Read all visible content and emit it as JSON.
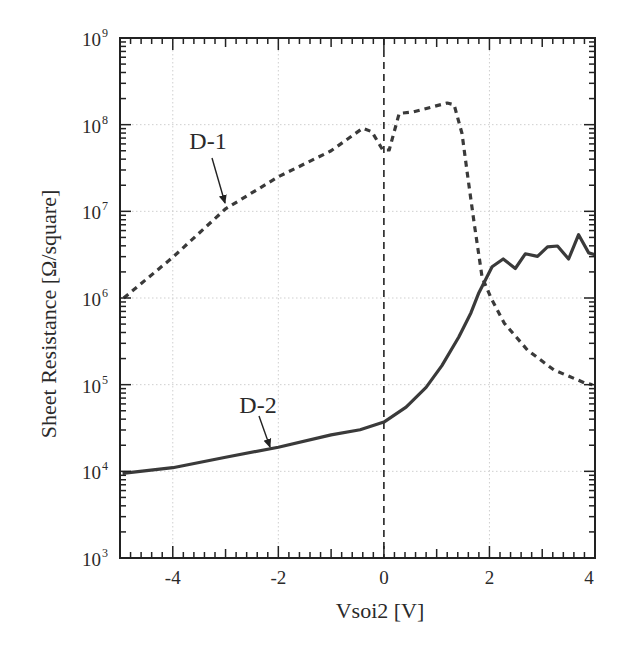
{
  "chart_data": {
    "type": "line",
    "title": "",
    "xlabel": "Vsoi2 [V]",
    "ylabel": "Sheet Resistance [Ω/square]",
    "xlim": [
      -5,
      4
    ],
    "ylim": [
      1000,
      1000000000
    ],
    "yscale": "log",
    "x_ticks": [
      -4,
      -2,
      0,
      2,
      4
    ],
    "x_tick_labels": [
      "-4",
      "-2",
      "0",
      "2",
      "4"
    ],
    "y_ticks": [
      1000,
      10000,
      100000,
      1000000,
      10000000,
      100000000,
      1000000000
    ],
    "y_tick_labels": [
      {
        "base": "10",
        "exp": "3"
      },
      {
        "base": "10",
        "exp": "4"
      },
      {
        "base": "10",
        "exp": "5"
      },
      {
        "base": "10",
        "exp": "6"
      },
      {
        "base": "10",
        "exp": "7"
      },
      {
        "base": "10",
        "exp": "8"
      },
      {
        "base": "10",
        "exp": "9"
      }
    ],
    "grid": true,
    "legend": null,
    "reference_lines": [
      {
        "orientation": "vertical",
        "x": 0,
        "style": "dashed"
      }
    ],
    "annotations": [
      {
        "text": "D-1",
        "arrow_to": {
          "x": -2.97,
          "y": 10700000
        }
      },
      {
        "text": "D-2",
        "arrow_to": {
          "x": -2.15,
          "y": 17800
        }
      }
    ],
    "series": [
      {
        "name": "D-1",
        "style": "dashed",
        "x": [
          -4.93,
          -4.0,
          -3.0,
          -2.0,
          -1.0,
          -0.4,
          -0.23,
          -0.02,
          0.1,
          0.29,
          0.55,
          1.2,
          1.33,
          1.48,
          1.58,
          1.71,
          1.86,
          2.03,
          2.28,
          2.72,
          3.22,
          3.8,
          3.95
        ],
        "y": [
          1000000,
          2950000,
          10700000,
          25000000,
          50000000,
          91000000,
          83000000,
          51000000,
          51000000,
          135000000,
          140000000,
          178000000,
          170000000,
          79000000,
          27500000,
          7400000,
          1740000,
          1000000,
          513000,
          251000,
          148000,
          105000,
          100000
        ]
      },
      {
        "name": "D-2",
        "style": "solid",
        "x": [
          -4.95,
          -4.0,
          -3.0,
          -2.0,
          -1.0,
          -0.45,
          0.0,
          0.42,
          0.8,
          1.1,
          1.42,
          1.65,
          1.8,
          2.05,
          2.26,
          2.49,
          2.68,
          2.91,
          3.1,
          3.29,
          3.5,
          3.69,
          3.88,
          4.0
        ],
        "y": [
          9500,
          11000,
          14500,
          19000,
          26300,
          30200,
          37000,
          55000,
          93000,
          166000,
          355000,
          676000,
          1150000,
          2290000,
          2820000,
          2190000,
          3240000,
          3020000,
          3890000,
          3980000,
          2820000,
          5370000,
          3310000,
          3160000
        ]
      }
    ]
  },
  "labels": {
    "xlabel": "Vsoi2 [V]",
    "ylabel": "Sheet Resistance [Ω/square]",
    "d1": "D-1",
    "d2": "D-2"
  }
}
